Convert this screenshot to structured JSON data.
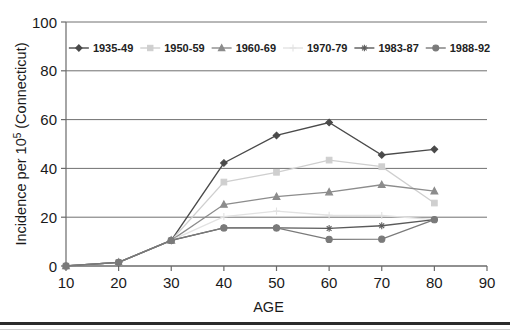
{
  "chart_data": {
    "type": "line",
    "title": "",
    "subtitle": "",
    "xlabel": "AGE",
    "ylabel": "Incidence per 10⁵ (Connecticut)",
    "ylabel_base": "Incidence per 10",
    "ylabel_exponent": "5",
    "ylabel_suffix": " (Connecticut)",
    "x": [
      10,
      20,
      30,
      40,
      50,
      60,
      70,
      80
    ],
    "xlim": [
      10,
      90
    ],
    "ylim": [
      0,
      100
    ],
    "xticks": [
      "10",
      "20",
      "30",
      "40",
      "50",
      "60",
      "70",
      "80",
      "90"
    ],
    "yticks": [
      "0",
      "20",
      "40",
      "60",
      "80",
      "100"
    ],
    "grid": "horizontal",
    "legend_position": "top-inside",
    "series": [
      {
        "name": "1935-49",
        "color": "#4a4a4a",
        "marker": "diamond",
        "values": [
          0,
          1.5,
          10.5,
          42.2,
          53.5,
          58.8,
          45.5,
          47.8
        ]
      },
      {
        "name": "1950-59",
        "color": "#cfcfcf",
        "marker": "square",
        "values": [
          0,
          1.5,
          10.5,
          34.4,
          38.4,
          43.4,
          40.7,
          25.8
        ]
      },
      {
        "name": "1960-69",
        "color": "#8c8c8c",
        "marker": "triangle",
        "values": [
          0,
          1.5,
          10.5,
          25.2,
          28.4,
          30.3,
          33.3,
          30.7
        ]
      },
      {
        "name": "1970-79",
        "color": "#e2e2e2",
        "marker": "cross",
        "values": [
          0,
          1.5,
          10.5,
          20.2,
          22.5,
          20.8,
          20.7,
          19.0
        ]
      },
      {
        "name": "1983-87",
        "color": "#5a5a5a",
        "marker": "star",
        "values": [
          0,
          1.5,
          10.5,
          15.6,
          15.6,
          15.4,
          16.5,
          19.0
        ]
      },
      {
        "name": "1988-92",
        "color": "#7a7a7a",
        "marker": "circle",
        "values": [
          0,
          1.5,
          10.5,
          15.6,
          15.6,
          10.9,
          11.0,
          19.0
        ]
      }
    ]
  },
  "axis": {
    "x_title": "AGE",
    "y_title": "Incidence per 10⁵ (Connecticut)"
  }
}
